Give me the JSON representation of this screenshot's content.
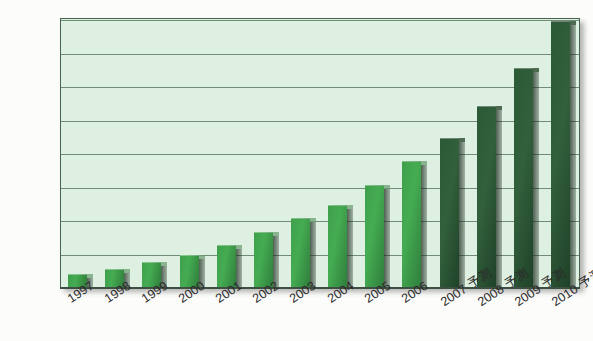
{
  "chart_data": {
    "type": "bar",
    "title": "",
    "xlabel": "",
    "ylabel": "",
    "ylim": [
      0,
      160000
    ],
    "ytick_step": 20000,
    "grid": true,
    "legend": "none",
    "categories": [
      "1997",
      "1998",
      "1999",
      "2000",
      "2001",
      "2002",
      "2003",
      "2004",
      "2005",
      "2006",
      "2007 予測",
      "2008 予測",
      "2009 予測",
      "2010 予測"
    ],
    "values": [
      8000,
      11000,
      15000,
      19000,
      25000,
      33000,
      41000,
      49000,
      61000,
      75000,
      89000,
      108000,
      131000,
      159000
    ],
    "forecast_from_index": 10,
    "ytick_labels": [
      "0",
      "20,000",
      "40,000",
      "60,000",
      "80,000",
      "100,000",
      "120,000",
      "140,000",
      "160,000"
    ],
    "ytick_values": [
      0,
      20000,
      40000,
      60000,
      80000,
      100000,
      120000,
      140000,
      160000
    ],
    "colors": {
      "bar_actual": "#3f9f4c",
      "bar_forecast": "#2b5a37",
      "plot_background": "#ddf0e2",
      "gridline": "#5d7a63",
      "axis_text": "#2b2b2b"
    }
  }
}
